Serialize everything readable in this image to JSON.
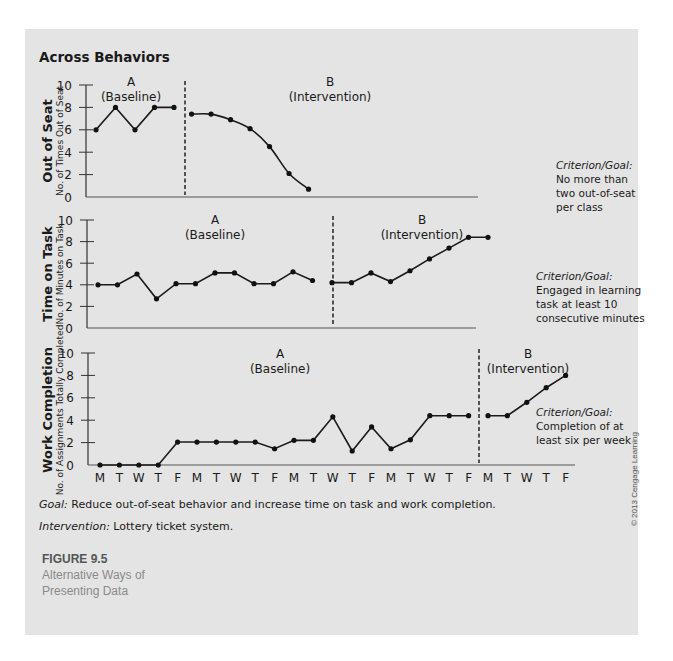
{
  "figure": {
    "heading": "Across Behaviors",
    "goal_label": "Goal:",
    "goal_text": " Reduce out-of-seat behavior and increase time on task and work completion.",
    "intervention_label": "Intervention:",
    "intervention_text": " Lottery ticket system.",
    "figure_number": "FIGURE 9.5",
    "caption_line1": "Alternative Ways of",
    "caption_line2": "Presenting Data",
    "copyright": "© 2013 Cengage Learning"
  },
  "chart_data": [
    {
      "type": "line",
      "title": "Out of Seat",
      "ylabel": "No. of Times Out of Seat",
      "ylim": [
        0,
        10
      ],
      "yticks": [
        "0",
        "2",
        "4",
        "6",
        "8",
        "10"
      ],
      "phases": [
        {
          "letter": "A",
          "name": "(Baseline)"
        },
        {
          "letter": "B",
          "name": "(Intervention)"
        }
      ],
      "series": [
        {
          "name": "A (Baseline)",
          "x": [
            0,
            1,
            2,
            3,
            4
          ],
          "values": [
            6,
            8,
            6,
            8,
            8
          ],
          "smooth": false
        },
        {
          "name": "B (Intervention)",
          "x": [
            4.9,
            5.9,
            6.9,
            7.9,
            8.9,
            9.9,
            10.9
          ],
          "values": [
            7.4,
            7.4,
            6.9,
            6.1,
            4.5,
            2.1,
            0.7
          ],
          "smooth": true
        }
      ],
      "phase_change_after": 4,
      "criterion": {
        "label": "Criterion/Goal:",
        "lines": [
          "No more than",
          "two out-of-seat",
          "per class"
        ]
      }
    },
    {
      "type": "line",
      "title": "Time on Task",
      "ylabel": "No. of Minutes on Task",
      "ylim": [
        0,
        10
      ],
      "yticks": [
        "0",
        "2",
        "4",
        "6",
        "8",
        "10"
      ],
      "phases": [
        {
          "letter": "A",
          "name": "(Baseline)"
        },
        {
          "letter": "B",
          "name": "(Intervention)"
        }
      ],
      "series": [
        {
          "name": "A (Baseline)",
          "x": [
            0,
            1,
            2,
            3,
            4,
            5,
            6,
            7,
            8,
            9,
            10,
            11
          ],
          "values": [
            4,
            4,
            5,
            2.7,
            4.1,
            4.1,
            5.1,
            5.1,
            4.1,
            4.1,
            5.2,
            4.4
          ],
          "smooth": false
        },
        {
          "name": "B (Intervention)",
          "x": [
            12,
            13,
            14,
            15,
            16,
            17,
            18,
            19,
            20
          ],
          "values": [
            4.2,
            4.2,
            5.1,
            4.3,
            5.3,
            6.4,
            7.4,
            8.4,
            8.4
          ],
          "smooth": false
        }
      ],
      "phase_change_after": 11,
      "criterion": {
        "label": "Criterion/Goal:",
        "lines": [
          "Engaged in learning",
          "task at least 10",
          "consecutive minutes"
        ]
      }
    },
    {
      "type": "line",
      "title": "Work Completion",
      "ylabel": "No. of Assignments Totally Completed",
      "ylim": [
        0,
        10
      ],
      "yticks": [
        "0",
        "2",
        "4",
        "6",
        "8",
        "10"
      ],
      "xlabels": [
        "M",
        "T",
        "W",
        "T",
        "F",
        "M",
        "T",
        "W",
        "T",
        "F",
        "M",
        "T",
        "W",
        "T",
        "F",
        "M",
        "T",
        "W",
        "T",
        "F",
        "M",
        "T",
        "W",
        "T",
        "F"
      ],
      "phases": [
        {
          "letter": "A",
          "name": "(Baseline)"
        },
        {
          "letter": "B",
          "name": "(Intervention)"
        }
      ],
      "series": [
        {
          "name": "A (Baseline)",
          "x": [
            0,
            1,
            2,
            3,
            4,
            5,
            6,
            7,
            8,
            9,
            10,
            11,
            12,
            13,
            14,
            15,
            16,
            17,
            18,
            19
          ],
          "values": [
            0,
            0,
            0,
            0,
            2.05,
            2.05,
            2.05,
            2.05,
            2.05,
            1.45,
            2.2,
            2.2,
            4.3,
            1.25,
            3.4,
            1.45,
            2.25,
            4.4,
            4.4,
            4.4
          ],
          "smooth": false
        },
        {
          "name": "B (Intervention)",
          "x": [
            20,
            21,
            22,
            23,
            24
          ],
          "values": [
            4.4,
            4.4,
            5.6,
            6.9,
            8.0
          ],
          "smooth": false
        }
      ],
      "phase_change_after": 19,
      "criterion": {
        "label": "Criterion/Goal:",
        "lines": [
          "Completion of at",
          "least six per week"
        ]
      }
    }
  ]
}
